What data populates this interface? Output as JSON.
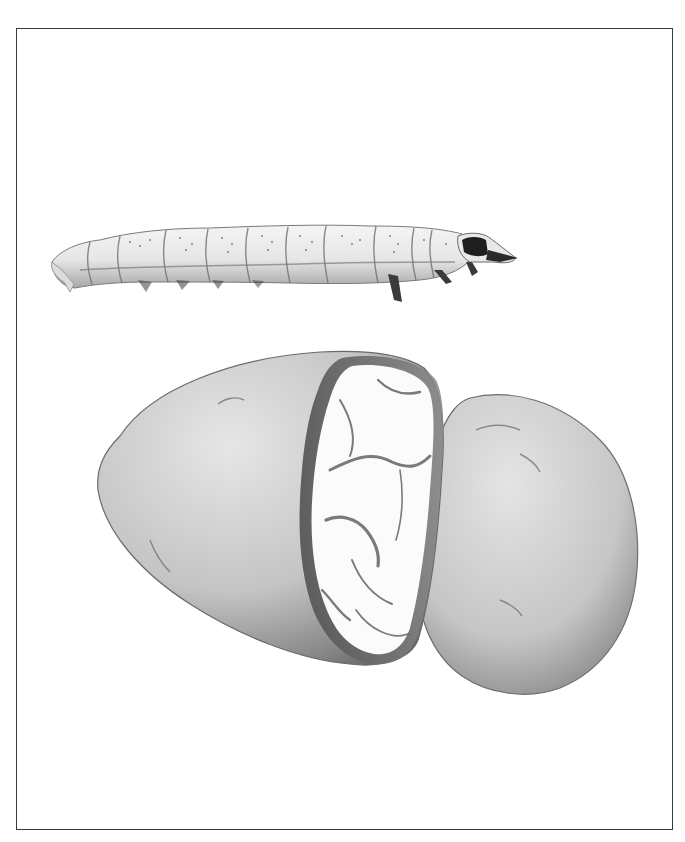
{
  "plate": {
    "subjects": [
      "larva",
      "potato-tuber-cut-open",
      "potato-tuber-half"
    ],
    "style": "grayscale-illustration",
    "colors": {
      "frame": "#3a3a3a",
      "background": "#ffffff",
      "larva_body": "#ececec",
      "larva_head": "#1e1e1e",
      "tuber_skin_light": "#d8d8d8",
      "tuber_skin_dark": "#6a6a6a",
      "tuber_flesh": "#fbfbfb"
    }
  }
}
